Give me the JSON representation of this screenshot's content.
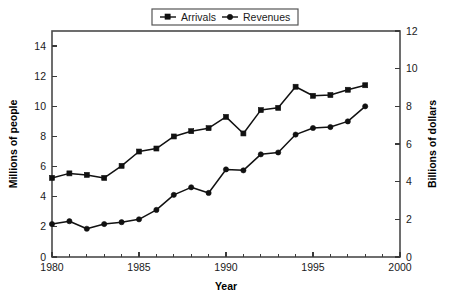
{
  "chart_data": {
    "type": "line",
    "title": "",
    "xlabel": "Year",
    "ylabel": "Millions of people",
    "y2label": "Billions of dollars",
    "x": [
      1980,
      1981,
      1982,
      1983,
      1984,
      1985,
      1986,
      1987,
      1988,
      1989,
      1990,
      1991,
      1992,
      1993,
      1994,
      1995,
      1996,
      1997,
      1998
    ],
    "xlim": [
      1980,
      2000
    ],
    "ylim": [
      0,
      15
    ],
    "y2lim": [
      0,
      12
    ],
    "xticks": [
      1980,
      1985,
      1990,
      1995,
      2000
    ],
    "xtick_labels": [
      "1980",
      "1985",
      "1990",
      "1995",
      "2000"
    ],
    "xminor_step": 1,
    "yticks": [
      0,
      2,
      4,
      6,
      8,
      10,
      12,
      14
    ],
    "ytick_labels": [
      "0",
      "2",
      "4",
      "6",
      "8",
      "10",
      "12",
      "14"
    ],
    "y2ticks": [
      0,
      2,
      4,
      6,
      8,
      10,
      12
    ],
    "y2tick_labels": [
      "0",
      "2",
      "4",
      "6",
      "8",
      "10",
      "12"
    ],
    "grid": "vertical-only",
    "legend_position": "top-center",
    "series": [
      {
        "name": "Arrivals",
        "axis": "left",
        "units": "Millions of people",
        "marker": "square",
        "color": "#111111",
        "values": [
          5.25,
          5.55,
          5.45,
          5.25,
          6.05,
          7.0,
          7.2,
          8.0,
          8.35,
          8.55,
          9.3,
          8.2,
          9.75,
          9.9,
          11.3,
          10.7,
          10.75,
          11.1,
          11.4
        ]
      },
      {
        "name": "Revenues",
        "axis": "right",
        "units": "Billions of dollars",
        "marker": "circle",
        "color": "#111111",
        "values": [
          1.75,
          1.9,
          1.5,
          1.75,
          1.85,
          2.0,
          2.5,
          3.3,
          3.7,
          3.4,
          4.65,
          4.6,
          5.45,
          5.55,
          6.5,
          6.85,
          6.9,
          7.2,
          8.0
        ]
      }
    ]
  },
  "legend": {
    "items": [
      {
        "label": "Arrivals"
      },
      {
        "label": "Revenues"
      }
    ]
  },
  "axes": {
    "left_title": "Millions of people",
    "right_title": "Billions of dollars",
    "bottom_title": "Year"
  }
}
